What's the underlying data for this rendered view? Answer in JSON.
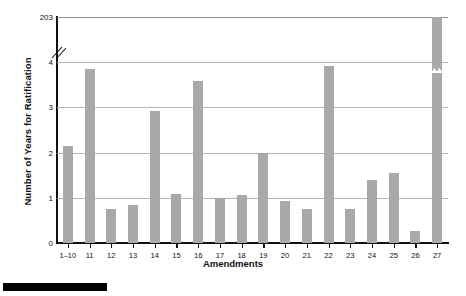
{
  "chart_data": {
    "type": "bar",
    "title": "",
    "xlabel": "Amendments",
    "ylabel": "Number of Years for Ratification",
    "categories": [
      "1–10",
      "11",
      "12",
      "13",
      "14",
      "15",
      "16",
      "17",
      "18",
      "19",
      "20",
      "21",
      "22",
      "23",
      "24",
      "25",
      "26",
      "27"
    ],
    "values": [
      2.15,
      3.85,
      0.75,
      0.83,
      2.92,
      1.08,
      3.58,
      1.0,
      1.05,
      2.0,
      0.92,
      0.75,
      3.92,
      0.75,
      1.4,
      1.55,
      0.27,
      203
    ],
    "ytick_labels": [
      "0",
      "1",
      "2",
      "3",
      "4",
      "203"
    ],
    "ytick_values": [
      0,
      1,
      2,
      3,
      4,
      203
    ],
    "ylim": [
      0,
      203
    ],
    "axis_break": {
      "present": true,
      "between": [
        4,
        203
      ],
      "note": "broken y-axis"
    },
    "grid": "horizontal",
    "legend": "none",
    "bar_color": "#a9a9a9",
    "grid_color": "#b4b4b4",
    "axis_color": "#111111"
  },
  "decoration": {
    "black_bar_label": ""
  }
}
